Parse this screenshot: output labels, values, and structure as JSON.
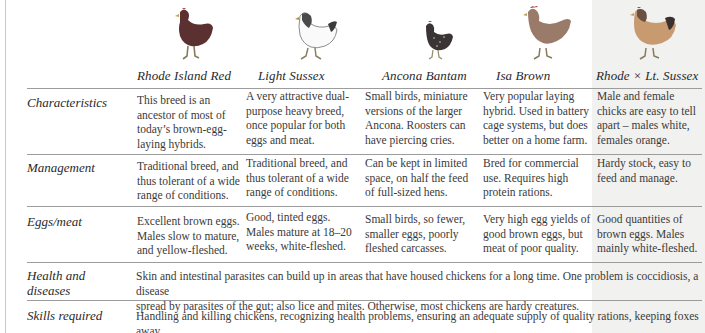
{
  "table": {
    "breeds": [
      {
        "name": "Rhode Island Red",
        "image": "chicken-dark-red-illustration"
      },
      {
        "name": "Light Sussex",
        "image": "chicken-white-black-neck-illustration"
      },
      {
        "name": "Ancona Bantam",
        "image": "chicken-small-black-speckled-illustration"
      },
      {
        "name": "Isa Brown",
        "image": "chicken-brown-illustration"
      },
      {
        "name": "Rhode × Lt. Sussex",
        "image": "chicken-orange-illustration"
      }
    ],
    "rows": [
      {
        "label": "Characteristics",
        "cells": [
          [
            "This breed is an",
            "ancestor of most of",
            "today’s brown-egg-",
            "laying hybrids."
          ],
          [
            "A very attractive dual-",
            "purpose heavy breed,",
            "once popular for both",
            "eggs and meat."
          ],
          [
            "Small birds, miniature",
            "versions of the larger",
            "Ancona. Roosters can",
            "have piercing cries."
          ],
          [
            "Very popular laying",
            "hybrid. Used in battery",
            "cage systems, but does",
            "better on a home farm."
          ],
          [
            "Male and female",
            "chicks are easy to tell",
            "apart – males white,",
            "females orange."
          ]
        ]
      },
      {
        "label": "Management",
        "cells": [
          [
            "Traditional breed, and",
            "thus tolerant of a wide",
            "range of conditions."
          ],
          [
            "Traditional breed, and",
            "thus tolerant of a wide",
            "range of conditions."
          ],
          [
            "Can be kept in limited",
            "space, on half the feed",
            "of full-sized hens."
          ],
          [
            "Bred for commercial",
            "use. Requires high",
            "protein rations."
          ],
          [
            "Hardy stock, easy to",
            "feed and manage."
          ]
        ]
      },
      {
        "label": "Eggs/meat",
        "cells": [
          [
            "Excellent brown eggs.",
            "Males slow to mature,",
            "and yellow-fleshed."
          ],
          [
            "Good, tinted eggs.",
            "Males mature at 18–20",
            "weeks, white-fleshed."
          ],
          [
            "Small birds, so fewer,",
            "smaller eggs, poorly",
            "fleshed carcasses."
          ],
          [
            "Very high egg yields of",
            "good brown eggs, but",
            "meat of poor quality."
          ],
          [
            "Good quantities of",
            "brown eggs. Males",
            "mainly white-fleshed."
          ]
        ]
      }
    ],
    "wide_rows": [
      {
        "label_lines": [
          "Health and",
          "diseases"
        ],
        "text_lines": [
          "Skin and intestinal parasites can build up in areas that have housed chickens for a long time. One problem is coccidiosis, a disease",
          "spread by parasites of the gut; also lice and mites. Otherwise, most chickens are hardy creatures."
        ]
      },
      {
        "label_lines": [
          "Skills required"
        ],
        "text_lines": [
          "Handling and killing chickens, recognizing health problems, ensuring an adequate supply of quality rations, keeping foxes away."
        ]
      }
    ]
  },
  "colors": {
    "text": "#2a2a2a",
    "rule": "#9c9c9c",
    "shaded_column": "#f1f1f0"
  }
}
